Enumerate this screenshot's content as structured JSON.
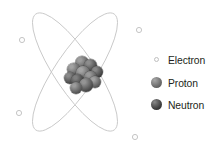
{
  "figure": {
    "background_color": "#ffffff",
    "width": 220,
    "height": 145
  },
  "orbits": {
    "color": "#c9c9c9",
    "stroke_width": 0.9,
    "center": {
      "x": 75,
      "y": 72
    },
    "ellipses": [
      {
        "name": "orbit-path-1",
        "rx": 20,
        "ry": 70,
        "rotation_deg": 34
      },
      {
        "name": "orbit-path-2",
        "rx": 20,
        "ry": 70,
        "rotation_deg": -34
      }
    ]
  },
  "electrons": {
    "marker_name": "electron-particle",
    "fill": "#fdfdfd",
    "stroke": "#bfbfbf",
    "radius": 2.6,
    "positions": [
      {
        "label": "electron-upper-left",
        "x": 22,
        "y": 40
      },
      {
        "label": "electron-upper-right",
        "x": 139,
        "y": 30
      },
      {
        "label": "electron-lower-left",
        "x": 19,
        "y": 113
      },
      {
        "label": "electron-lower-right",
        "x": 135,
        "y": 137
      }
    ]
  },
  "nucleus": {
    "center": {
      "x": 83,
      "y": 74
    },
    "particle_count": 11,
    "particles": [
      {
        "kind": "proton",
        "x": 13,
        "y": 3,
        "r": 7.0,
        "shade_light": "#9d9d9d",
        "shade_dark": "#4a4a4a"
      },
      {
        "kind": "neutron",
        "x": 22,
        "y": 6,
        "r": 6.6,
        "shade_light": "#8d8d8d",
        "shade_dark": "#3a3a3a"
      },
      {
        "kind": "proton",
        "x": 5,
        "y": 10,
        "r": 6.4,
        "shade_light": "#a2a2a2",
        "shade_dark": "#515151"
      },
      {
        "kind": "neutron",
        "x": 29,
        "y": 13,
        "r": 6.2,
        "shade_light": "#888888",
        "shade_dark": "#363636"
      },
      {
        "kind": "proton",
        "x": 14,
        "y": 13,
        "r": 6.8,
        "shade_light": "#a5a5a5",
        "shade_dark": "#555555"
      },
      {
        "kind": "neutron",
        "x": 2,
        "y": 19,
        "r": 6.0,
        "shade_light": "#8a8a8a",
        "shade_dark": "#3b3b3b"
      },
      {
        "kind": "proton",
        "x": 22,
        "y": 18,
        "r": 6.6,
        "shade_light": "#9a9a9a",
        "shade_dark": "#4d4d4d"
      },
      {
        "kind": "neutron",
        "x": 9,
        "y": 21,
        "r": 6.5,
        "shade_light": "#7f7f7f",
        "shade_dark": "#303030"
      },
      {
        "kind": "proton",
        "x": 27,
        "y": 23,
        "r": 6.2,
        "shade_light": "#a0a0a0",
        "shade_dark": "#4e4e4e"
      },
      {
        "kind": "neutron",
        "x": 17,
        "y": 25,
        "r": 7.0,
        "shade_light": "#949494",
        "shade_dark": "#3e3e3e"
      },
      {
        "kind": "proton",
        "x": 8,
        "y": 29,
        "r": 6.0,
        "shade_light": "#9b9b9b",
        "shade_dark": "#4a4a4a"
      }
    ]
  },
  "legend": {
    "items": [
      {
        "label": "Electron",
        "marker": "electron-swatch",
        "color": "#fdfdfd"
      },
      {
        "label": "Proton",
        "marker": "proton-swatch",
        "color": "#6a6a6a"
      },
      {
        "label": "Neutron",
        "marker": "neutron-swatch",
        "color": "#3f3f3f"
      }
    ],
    "text_color": "#231f20"
  }
}
